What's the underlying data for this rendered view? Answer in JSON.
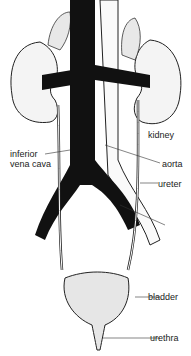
{
  "diagram": {
    "labels": {
      "kidney": "kidney",
      "ivc_line1": "inferior",
      "ivc_line2": "vena cava",
      "aorta": "aorta",
      "ureter": "ureter",
      "bladder": "bladder",
      "urethra": "urethra"
    }
  }
}
